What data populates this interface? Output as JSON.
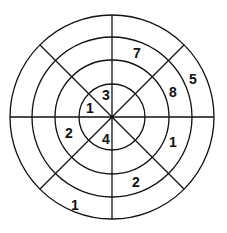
{
  "diagram": {
    "type": "concentric-circle-number-puzzle",
    "center": {
      "x": 112,
      "y": 117
    },
    "ring_radii": [
      33,
      57,
      80,
      102
    ],
    "sector_count": 8,
    "line_color": "#111111",
    "background_color": "#ffffff",
    "numbers": [
      {
        "id": "inner-upper-left-top",
        "value": "3",
        "ring": 1,
        "x": 106,
        "y": 95
      },
      {
        "id": "inner-upper-left-side",
        "value": "1",
        "ring": 1,
        "x": 90,
        "y": 108
      },
      {
        "id": "inner-lower-left",
        "value": "4",
        "ring": 1,
        "x": 106,
        "y": 139
      },
      {
        "id": "ring2-left-lower",
        "value": "2",
        "ring": 2,
        "x": 69,
        "y": 133
      },
      {
        "id": "ring2-right-lower",
        "value": "1",
        "ring": 2,
        "x": 173,
        "y": 142
      },
      {
        "id": "ring2-upper-right",
        "value": "8",
        "ring": 2,
        "x": 173,
        "y": 92
      },
      {
        "id": "ring3-top-right",
        "value": "7",
        "ring": 3,
        "x": 137,
        "y": 53
      },
      {
        "id": "ring3-bottom-right",
        "value": "2",
        "ring": 3,
        "x": 136,
        "y": 182
      },
      {
        "id": "ring4-upper-right",
        "value": "5",
        "ring": 4,
        "x": 193,
        "y": 79
      },
      {
        "id": "ring4-bottom-left",
        "value": "1",
        "ring": 4,
        "x": 75,
        "y": 205
      }
    ]
  }
}
